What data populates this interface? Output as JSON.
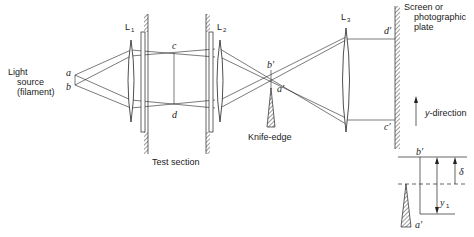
{
  "diagram": {
    "labels": {
      "light_source_line1": "Light",
      "light_source_line2": "source",
      "light_source_line3": "(filament)",
      "point_a": "a",
      "point_b": "b",
      "point_c": "c",
      "point_d": "d",
      "point_a_prime": "a′",
      "point_b_prime": "b′",
      "point_c_prime": "c′",
      "point_d_prime": "d′",
      "lens1": "L",
      "lens1_sub": "1",
      "lens2": "L",
      "lens2_sub": "2",
      "lens3": "L",
      "lens3_sub": "3",
      "test_section": "Test section",
      "knife_edge": "Knife-edge",
      "screen_line1": "Screen or",
      "screen_line2": "photographic",
      "screen_line3": "plate",
      "y_direction": "y-direction"
    },
    "inset": {
      "b_prime": "b′",
      "a_prime": "a′",
      "delta": "δ",
      "y1": "y",
      "y1_sub": "1"
    }
  }
}
